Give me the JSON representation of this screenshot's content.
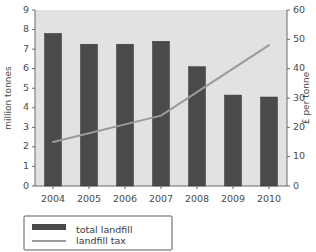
{
  "chart_data": {
    "type": "bar",
    "title": "",
    "subtitle": "",
    "xlabel": "",
    "ylabel": "million tonnes",
    "y2label": "£ per tonne",
    "categories": [
      "2004",
      "2005",
      "2006",
      "2007",
      "2008",
      "2009",
      "2010"
    ],
    "ylim": [
      0,
      9
    ],
    "y2lim": [
      0,
      60
    ],
    "yticks": [
      "0",
      "1",
      "2",
      "3",
      "4",
      "5",
      "6",
      "7",
      "8",
      "9"
    ],
    "y2ticks": [
      "0",
      "10",
      "20",
      "30",
      "40",
      "50",
      "60"
    ],
    "grid": false,
    "legend_position": "bottom",
    "series": [
      {
        "name": "total landfill",
        "type": "bar",
        "axis": "left",
        "unit": "million tonnes",
        "color": "#4a4a4a",
        "values": [
          7.8,
          7.25,
          7.25,
          7.4,
          6.1,
          4.65,
          4.55
        ]
      },
      {
        "name": "landfill tax",
        "type": "line",
        "axis": "right",
        "unit": "£ per tonne",
        "color": "#9a9a9a",
        "values": [
          15,
          18,
          21,
          24,
          32,
          40,
          48
        ]
      }
    ],
    "legend": [
      {
        "label": "total landfill",
        "marker": "bar",
        "color": "#4a4a4a"
      },
      {
        "label": "landfill tax",
        "marker": "line",
        "color": "#9a9a9a"
      }
    ],
    "colors": {
      "plot_background": "#e2e2e2",
      "page_background": "#ffffff",
      "bar": "#4a4a4a",
      "line": "#9a9a9a",
      "axis": "#6b6b6b",
      "text": "#3a3a3a"
    }
  }
}
